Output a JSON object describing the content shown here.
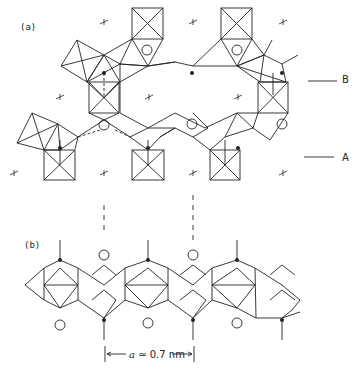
{
  "figure": {
    "panel_a": {
      "label": "(a)"
    },
    "panel_b": {
      "label": "(b)"
    },
    "level_markers": [
      {
        "label": "B"
      },
      {
        "label": "A"
      }
    ],
    "scale_bar": {
      "symbol": "a",
      "text": "≃ 0.7 nm"
    },
    "colors": {
      "stroke": "#222222",
      "background": "#ffffff"
    }
  }
}
